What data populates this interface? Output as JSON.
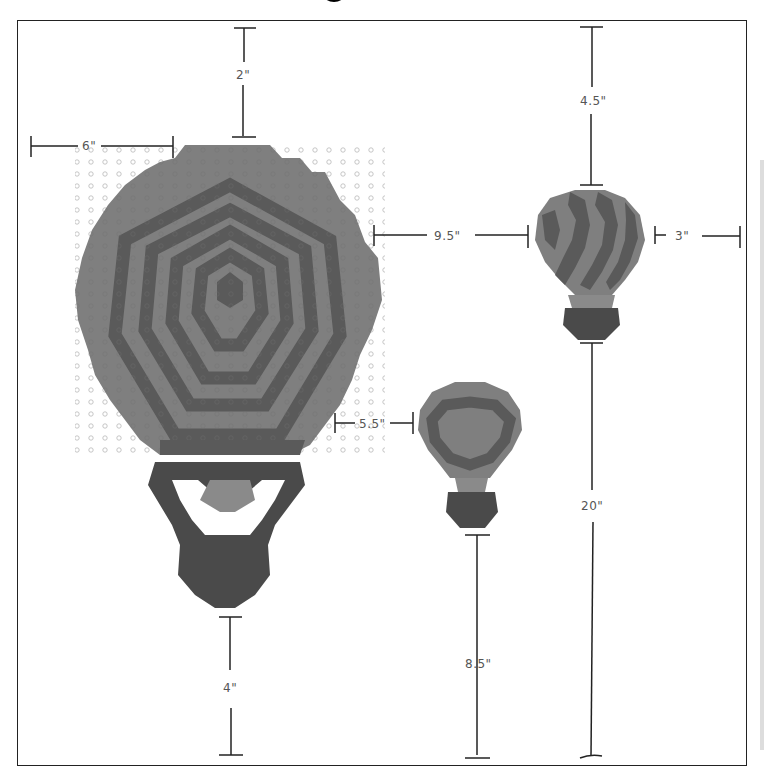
{
  "diagram": {
    "title_visible": "",
    "colors": {
      "light_fabric": "#7f7f7f",
      "dark_fabric": "#5a5a5a",
      "basket_dark": "#4a4a4a",
      "dimension_line": "#222222",
      "label_text": "#555555",
      "background": "#ffffff"
    },
    "balloons": [
      {
        "id": "large",
        "description": "Large balloon with concentric hexagon rings",
        "basket": "dark outlined basket"
      },
      {
        "id": "medium",
        "description": "Medium balloon with dark heart-shaped ring"
      },
      {
        "id": "small",
        "description": "Small balloon with diagonal stripes"
      }
    ],
    "dimensions": {
      "top_to_large": "2\"",
      "left_to_large": "6\"",
      "top_to_small": "4.5\"",
      "large_to_small": "9.5\"",
      "small_to_right": "3\"",
      "large_to_medium": "5.5\"",
      "small_to_bottom": "20\"",
      "medium_to_bottom": "8.5\"",
      "large_to_bottom": "4\""
    }
  }
}
